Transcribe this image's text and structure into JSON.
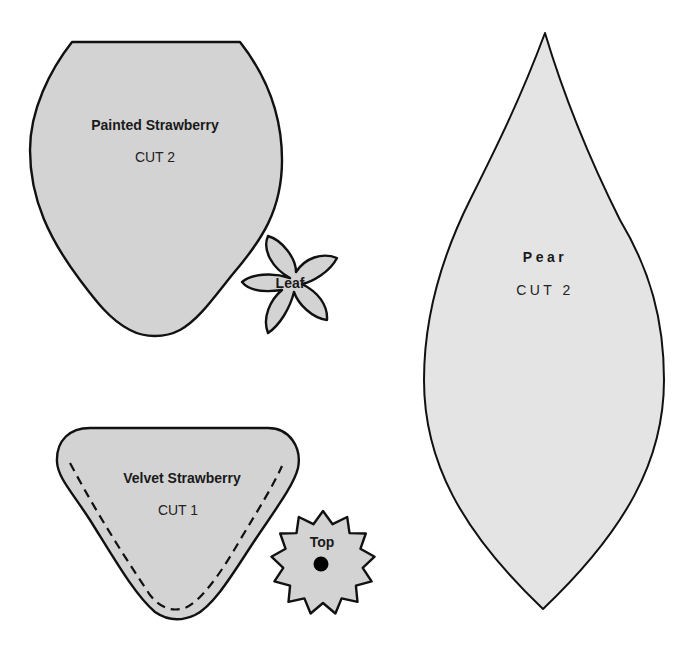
{
  "sheet": {
    "pieces": [
      {
        "id": "painted-strawberry",
        "name": "Painted Strawberry",
        "instruction": "CUT 2"
      },
      {
        "id": "leaf",
        "name": "Leaf"
      },
      {
        "id": "pear",
        "name": "Pear",
        "instruction": "CUT 2"
      },
      {
        "id": "velvet-strawberry",
        "name": "Velvet Strawberry",
        "instruction": "CUT 1"
      },
      {
        "id": "top",
        "name": "Top"
      }
    ]
  },
  "colors": {
    "outline": "#111111",
    "strawberry_fill": "#d3d3d3",
    "pear_fill": "#e4e4e4",
    "background": "#ffffff"
  }
}
